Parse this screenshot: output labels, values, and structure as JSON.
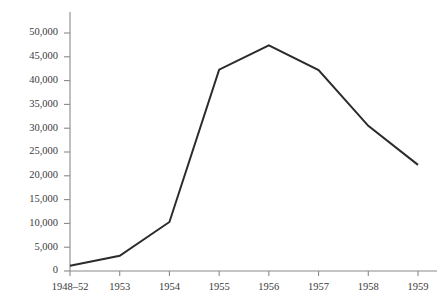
{
  "chart_data": {
    "type": "line",
    "title": "",
    "subtitle": "",
    "xlabel": "",
    "ylabel": "",
    "categories": [
      "1948–52",
      "1953",
      "1954",
      "1955",
      "1956",
      "1957",
      "1958",
      "1959"
    ],
    "values": [
      1100,
      3200,
      10300,
      42300,
      47400,
      42200,
      30500,
      22300
    ],
    "series": [
      {
        "name": "",
        "values": [
          1100,
          3200,
          10300,
          42300,
          47400,
          42200,
          30500,
          22300
        ],
        "color": "#2b2b2b"
      }
    ],
    "ylim": [
      0,
      52000
    ],
    "ytick_values": [
      0,
      5000,
      10000,
      15000,
      20000,
      25000,
      30000,
      35000,
      40000,
      45000,
      50000
    ],
    "ytick_labels": [
      "0",
      "5,000",
      "10,000",
      "15,000",
      "20,000",
      "25,000",
      "30,000",
      "35,000",
      "40,000",
      "45,000",
      "50,000"
    ],
    "xtick_labels": [
      "1948–52",
      "1953",
      "1954",
      "1955",
      "1956",
      "1957",
      "1958",
      "1959"
    ],
    "grid": false,
    "legend": null,
    "legend_position": "none",
    "annotations": [],
    "background_color": "#ffffff",
    "axis_color": "#8a8a8a",
    "text_color": "#3a3a3a"
  }
}
